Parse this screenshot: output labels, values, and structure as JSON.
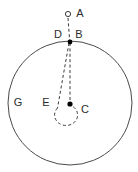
{
  "figure": {
    "background_color": "#ffffff",
    "stroke_color": "#4a4a4a",
    "dash_color": "#3a3a3a",
    "label_color": "#2b2b2b",
    "outer_circle": {
      "cx": 70,
      "cy": 103,
      "r": 62
    },
    "labels": {
      "a": "A",
      "b": "B",
      "c": "C",
      "d": "D",
      "e": "E",
      "g": "G"
    },
    "label_positions": {
      "a": {
        "x": 80,
        "y": 14
      },
      "b": {
        "x": 79,
        "y": 35
      },
      "c": {
        "x": 85,
        "y": 110
      },
      "d": {
        "x": 58,
        "y": 35
      },
      "e": {
        "x": 46,
        "y": 103
      },
      "g": {
        "x": 18,
        "y": 103
      }
    },
    "points": {
      "a": {
        "x": 68,
        "y": 14,
        "style": "hollow",
        "r": 2.6
      },
      "b": {
        "x": 70,
        "y": 42,
        "style": "filled",
        "r": 2.4
      },
      "c": {
        "x": 70,
        "y": 104,
        "style": "filled",
        "r": 2.6
      }
    },
    "paths": {
      "a_to_b": "M 68 18 L 69.6 40",
      "b_to_c": "M 70 43 L 70 103",
      "b_to_e": "M 69 43 L 57.5 108",
      "loop_arc": "M 57.5 108 A 11.5 10.5 0 1 0 72.4 106.2"
    }
  }
}
